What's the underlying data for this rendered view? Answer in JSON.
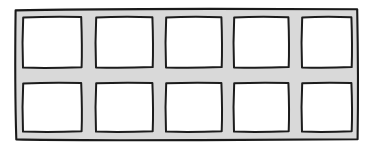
{
  "figure": {
    "kind": "hand-drawn-sketch",
    "title": "",
    "caption": "",
    "background_color": "#ffffff",
    "ink_color": "#1c1c1c",
    "frame_fill_color": "#d9d9d9",
    "pane_fill_color": "#ffffff",
    "canvas": {
      "width": 377,
      "height": 148
    },
    "outer_frame": {
      "x": 14,
      "y": 8,
      "width": 345,
      "height": 133,
      "stroke_width": 2.1
    },
    "grid": {
      "rows": 2,
      "columns": 5,
      "pane_count": 10,
      "vertical_divider_x": [
        89,
        159,
        227,
        295
      ],
      "horizontal_divider_y": [
        75
      ],
      "mullion_thickness": 7
    },
    "panes": [
      {
        "id": "pane-r1c1",
        "row": 1,
        "column": 1,
        "x": 22,
        "y": 16,
        "width": 60,
        "height": 52
      },
      {
        "id": "pane-r1c2",
        "row": 1,
        "column": 2,
        "x": 95,
        "y": 16,
        "width": 58,
        "height": 52
      },
      {
        "id": "pane-r1c3",
        "row": 1,
        "column": 3,
        "x": 165,
        "y": 16,
        "width": 57,
        "height": 52
      },
      {
        "id": "pane-r1c4",
        "row": 1,
        "column": 4,
        "x": 233,
        "y": 16,
        "width": 56,
        "height": 52
      },
      {
        "id": "pane-r1c5",
        "row": 1,
        "column": 5,
        "x": 301,
        "y": 16,
        "width": 51,
        "height": 52
      },
      {
        "id": "pane-r2c1",
        "row": 2,
        "column": 1,
        "x": 22,
        "y": 82,
        "width": 60,
        "height": 50
      },
      {
        "id": "pane-r2c2",
        "row": 2,
        "column": 2,
        "x": 95,
        "y": 82,
        "width": 58,
        "height": 50
      },
      {
        "id": "pane-r2c3",
        "row": 2,
        "column": 3,
        "x": 165,
        "y": 82,
        "width": 57,
        "height": 50
      },
      {
        "id": "pane-r2c4",
        "row": 2,
        "column": 4,
        "x": 233,
        "y": 82,
        "width": 56,
        "height": 50
      },
      {
        "id": "pane-r2c5",
        "row": 2,
        "column": 5,
        "x": 301,
        "y": 82,
        "width": 51,
        "height": 50
      }
    ]
  }
}
